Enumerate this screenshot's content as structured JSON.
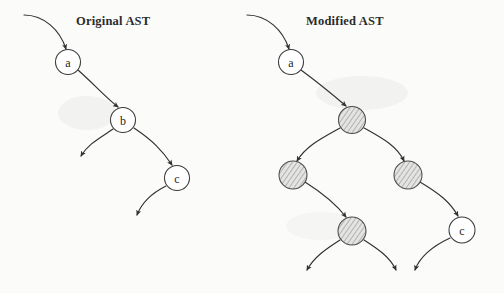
{
  "figure": {
    "width": 504,
    "height": 293,
    "background": "#fbfbfa",
    "ink_color": "#33312f",
    "shade_color": "#b9b9b9"
  },
  "panels": [
    {
      "id": "original",
      "title": "Original AST",
      "title_x": 76,
      "title_y": 14
    },
    {
      "id": "modified",
      "title": "Modified AST",
      "title_x": 306,
      "title_y": 14
    }
  ],
  "nodes": [
    {
      "id": "l-a",
      "panel": "original",
      "label": "a",
      "cx": 68,
      "cy": 62,
      "r": 12.5,
      "style": "plain"
    },
    {
      "id": "l-b",
      "panel": "original",
      "label": "b",
      "cx": 123,
      "cy": 120,
      "r": 12.5,
      "style": "plain"
    },
    {
      "id": "l-c",
      "panel": "original",
      "label": "c",
      "cx": 177,
      "cy": 178,
      "r": 12.5,
      "style": "plain"
    },
    {
      "id": "r-a",
      "panel": "modified",
      "label": "a",
      "cx": 291,
      "cy": 62,
      "r": 12.5,
      "style": "plain"
    },
    {
      "id": "r-s1",
      "panel": "modified",
      "label": "",
      "cx": 352,
      "cy": 120,
      "r": 13.5,
      "style": "shaded"
    },
    {
      "id": "r-s2",
      "panel": "modified",
      "label": "",
      "cx": 293,
      "cy": 175,
      "r": 14.0,
      "style": "shaded"
    },
    {
      "id": "r-s3",
      "panel": "modified",
      "label": "",
      "cx": 408,
      "cy": 175,
      "r": 14.0,
      "style": "shaded"
    },
    {
      "id": "r-s4",
      "panel": "modified",
      "label": "",
      "cx": 352,
      "cy": 231,
      "r": 14.0,
      "style": "shaded"
    },
    {
      "id": "r-c",
      "panel": "modified",
      "label": "c",
      "cx": 462,
      "cy": 230,
      "r": 13.0,
      "style": "plain"
    }
  ],
  "edges": [
    {
      "id": "l-root-in",
      "panel": "original",
      "path": "M 24,15 C 44,15 60,30 66,49",
      "arrow": true
    },
    {
      "id": "l-a-b",
      "panel": "original",
      "path": "M 78,70 C 96,86 104,96 118,107",
      "arrow": true
    },
    {
      "id": "l-b-left",
      "panel": "original",
      "path": "M 113,129 C 100,138 88,144 81,156",
      "arrow": true
    },
    {
      "id": "l-b-c",
      "panel": "original",
      "path": "M 134,128 C 152,140 162,150 172,165",
      "arrow": true
    },
    {
      "id": "l-c-down",
      "panel": "original",
      "path": "M 166,186 C 152,193 142,202 137,215",
      "arrow": true
    },
    {
      "id": "r-root-in",
      "panel": "modified",
      "path": "M 247,15 C 267,15 283,30 289,49",
      "arrow": true
    },
    {
      "id": "r-a-s1",
      "panel": "modified",
      "path": "M 301,70 C 320,84 332,94 346,106",
      "arrow": true
    },
    {
      "id": "r-s1-s2",
      "panel": "modified",
      "path": "M 340,128 C 322,138 306,146 297,161",
      "arrow": true
    },
    {
      "id": "r-s1-s3",
      "panel": "modified",
      "path": "M 364,128 C 382,138 397,146 404,161",
      "arrow": true
    },
    {
      "id": "r-s2-s4",
      "panel": "modified",
      "path": "M 305,182 C 324,194 336,204 346,217",
      "arrow": true
    },
    {
      "id": "r-s3-c",
      "panel": "modified",
      "path": "M 420,182 C 440,194 450,202 458,216",
      "arrow": true
    },
    {
      "id": "r-s4-left",
      "panel": "modified",
      "path": "M 340,240 C 326,249 314,257 307,270",
      "arrow": true
    },
    {
      "id": "r-s4-right",
      "panel": "modified",
      "path": "M 364,240 C 378,249 390,257 396,270",
      "arrow": true
    },
    {
      "id": "r-c-down",
      "panel": "modified",
      "path": "M 450,238 C 433,246 420,256 415,270",
      "arrow": true
    }
  ]
}
